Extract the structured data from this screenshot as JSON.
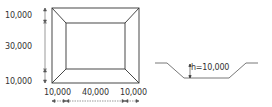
{
  "plan_view": {
    "left_labels": {
      "top": "10,000",
      "middle": "30,000",
      "bottom": "10,000"
    },
    "bottom_labels": {
      "left": "10,000",
      "middle": "40,000",
      "right": "10,000"
    }
  },
  "section_view": {
    "depth_label": "h=10,000"
  },
  "colors": {
    "line": "#333333",
    "dim": "#555555"
  }
}
